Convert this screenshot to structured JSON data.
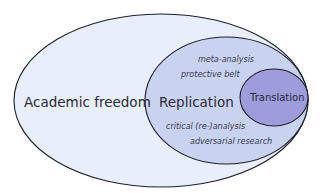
{
  "diagram": {
    "type": "nested-ellipses",
    "colors": {
      "background": "#ffffff",
      "outer_fill": "#e8effa",
      "middle_fill": "#c9d3f0",
      "inner_fill": "#9d9ddc",
      "stroke": "#1e1e2a",
      "text": "#2a2a38"
    },
    "outer": {
      "label": "Academic freedom"
    },
    "middle": {
      "label": "Replication",
      "sub_items": [
        "meta-analysis",
        "protective belt",
        "critical (re-)analysis",
        "adversarial research"
      ]
    },
    "inner": {
      "label": "Translation"
    }
  }
}
